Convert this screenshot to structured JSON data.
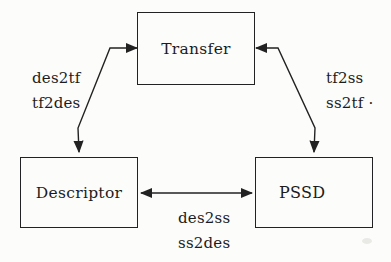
{
  "diagram": {
    "nodes": {
      "transfer": {
        "label": "Transfer"
      },
      "descriptor": {
        "label": "Descriptor"
      },
      "pssd": {
        "label": "PSSD"
      }
    },
    "edges": {
      "transfer_descriptor": {
        "line1": "des2tf",
        "line2": "tf2des"
      },
      "transfer_pssd": {
        "line1": "tf2ss",
        "line2": "ss2tf ·"
      },
      "descriptor_pssd": {
        "line1": "des2ss",
        "line2": "ss2des"
      }
    },
    "colors": {
      "background": "#fcfcfb",
      "line": "#222222",
      "text": "#1c1c1c"
    }
  }
}
